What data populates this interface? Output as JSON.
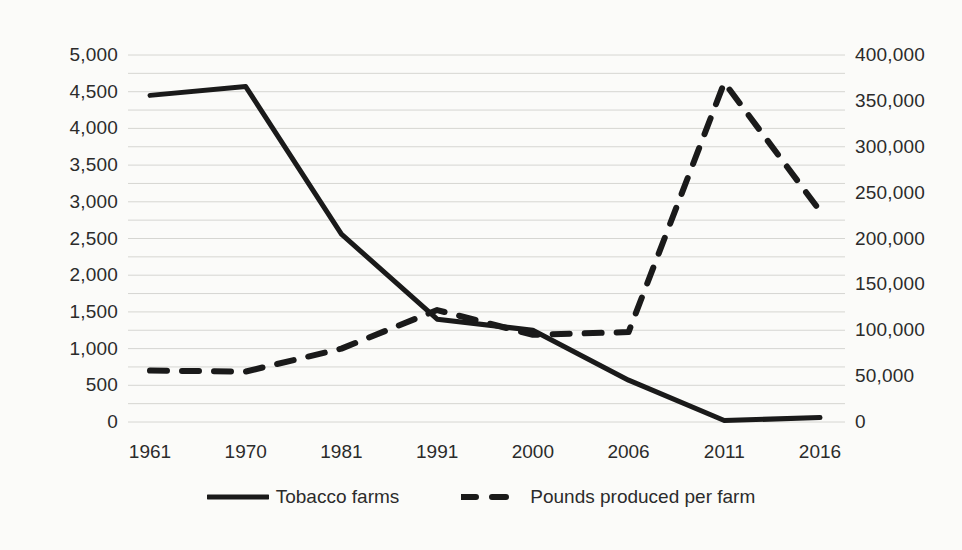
{
  "chart_data": {
    "type": "line",
    "title": "",
    "subtitle": "",
    "xlabel": "",
    "ylabel": "",
    "grid": true,
    "legend_position": "bottom",
    "categories": [
      "1961",
      "1970",
      "1981",
      "1991",
      "2000",
      "2006",
      "2011",
      "2016"
    ],
    "series": [
      {
        "name": "Tobacco farms",
        "axis": "left",
        "style": "solid",
        "color": "#1a1a1a",
        "values": [
          4450,
          4570,
          2560,
          1400,
          1250,
          570,
          20,
          60
        ]
      },
      {
        "name": "Pounds produced per farm",
        "axis": "right",
        "style": "dashed",
        "color": "#1a1a1a",
        "values": [
          56000,
          55000,
          80000,
          122000,
          95000,
          98000,
          370000,
          230000
        ]
      }
    ],
    "axes": {
      "left": {
        "ylim": [
          0,
          5000
        ],
        "tick_step": 500,
        "ticks": [
          "0",
          "500",
          "1,000",
          "1,500",
          "2,000",
          "2,500",
          "3,000",
          "3,500",
          "4,000",
          "4,500",
          "5,000"
        ]
      },
      "right": {
        "ylim": [
          0,
          400000
        ],
        "tick_step": 50000,
        "ticks": [
          "0",
          "50,000",
          "100,000",
          "150,000",
          "200,000",
          "250,000",
          "300,000",
          "350,000",
          "400,000"
        ]
      },
      "x": {
        "ticks": [
          "1961",
          "1970",
          "1981",
          "1991",
          "2000",
          "2006",
          "2011",
          "2016"
        ]
      }
    },
    "gridline_count": 21,
    "colors": {
      "background": "#fbfbf9",
      "gridline": "#d6d6d2",
      "series": "#1a1a1a",
      "text": "#2b2b2b"
    }
  },
  "legend": {
    "items": [
      {
        "label": "Tobacco farms",
        "style": "solid"
      },
      {
        "label": "Pounds produced per farm",
        "style": "dashed"
      }
    ]
  }
}
